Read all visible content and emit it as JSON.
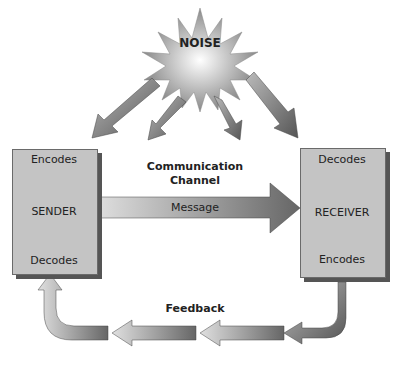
{
  "noise": {
    "label": "NOISE"
  },
  "sender": {
    "title": "SENDER",
    "top": "Encodes",
    "bottom": "Decodes"
  },
  "channel": {
    "title_line1": "Communication",
    "title_line2": "Channel",
    "message": "Message"
  },
  "receiver": {
    "title": "RECEIVER",
    "top": "Decodes",
    "bottom": "Encodes"
  },
  "feedback": {
    "title": "Feedback"
  },
  "colors": {
    "box": "#c4c4c4",
    "box_shadow": "#555555",
    "dark_arrow": "#666666",
    "light_arrow": "#d8d8d8"
  }
}
